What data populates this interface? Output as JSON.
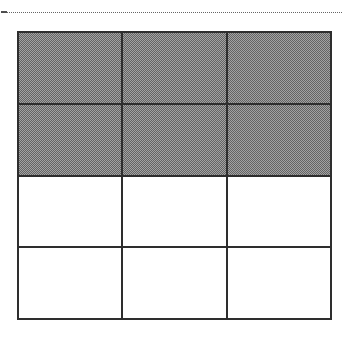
{
  "page": {
    "background_color": "#ffffff"
  },
  "top_rule": {
    "style": "dotted",
    "color": "#4a4a4a",
    "label": "horizontal dotted separator rule"
  },
  "figure": {
    "name": "fraction-grid",
    "columns": 3,
    "rows": 4,
    "total_cells": 12,
    "shaded_cells": 6,
    "unshaded_cells": 6,
    "fraction_shaded": "6/12",
    "border_color": "#2e2e2e",
    "shaded_color": "#9a9a9a",
    "unshaded_color": "#ffffff",
    "cells": [
      {
        "row": 1,
        "col": 1,
        "state": "shaded",
        "label": ""
      },
      {
        "row": 1,
        "col": 2,
        "state": "shaded",
        "label": ""
      },
      {
        "row": 1,
        "col": 3,
        "state": "shaded",
        "label": ""
      },
      {
        "row": 2,
        "col": 1,
        "state": "shaded",
        "label": ""
      },
      {
        "row": 2,
        "col": 2,
        "state": "shaded",
        "label": ""
      },
      {
        "row": 2,
        "col": 3,
        "state": "shaded",
        "label": ""
      },
      {
        "row": 3,
        "col": 1,
        "state": "unshaded",
        "label": ""
      },
      {
        "row": 3,
        "col": 2,
        "state": "unshaded",
        "label": ""
      },
      {
        "row": 3,
        "col": 3,
        "state": "unshaded",
        "label": ""
      },
      {
        "row": 4,
        "col": 1,
        "state": "unshaded",
        "label": ""
      },
      {
        "row": 4,
        "col": 2,
        "state": "unshaded",
        "label": ""
      },
      {
        "row": 4,
        "col": 3,
        "state": "unshaded",
        "label": ""
      }
    ]
  }
}
